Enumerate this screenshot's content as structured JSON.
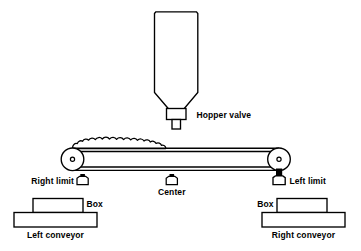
{
  "diagram": {
    "stroke_color": "#000000",
    "fill_color": "#ffffff",
    "accent_color": "#1a1a1a",
    "background": "#ffffff"
  },
  "labels": {
    "hopper_valve": "Hopper valve",
    "right_limit": "Right limit",
    "center": "Center",
    "left_limit": "Left limit",
    "box_left": "Box",
    "box_right": "Box",
    "left_conveyor": "Left conveyor",
    "right_conveyor": "Right conveyor"
  },
  "components": {
    "hopper": {
      "name": "hopper-tank",
      "description": "Vertical storage tank with tapered bottom funnel"
    },
    "valve": {
      "name": "hopper-valve-body",
      "description": "Rectangular valve body with discharge nozzle"
    },
    "belt": {
      "name": "conveyor-belt",
      "description": "Horizontal belt spanning two end rollers"
    },
    "material_pile": {
      "name": "material-pile",
      "description": "Lumpy granular material heaped on belt left of valve"
    },
    "roller_left": {
      "name": "belt-roller-left",
      "description": "Left end roller with hub dot"
    },
    "roller_right": {
      "name": "belt-roller-right",
      "description": "Right end roller with hub dot"
    },
    "switches": [
      {
        "name": "right-limit-switch",
        "state": "inactive"
      },
      {
        "name": "center-switch",
        "state": "inactive"
      },
      {
        "name": "left-limit-switch",
        "state": "active"
      }
    ]
  }
}
